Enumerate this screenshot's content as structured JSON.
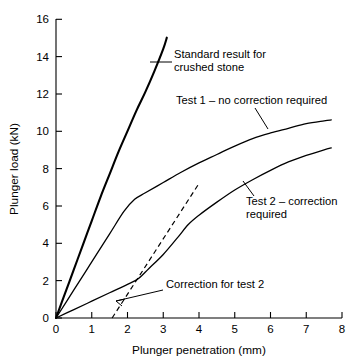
{
  "chart_data": {
    "type": "line",
    "title": "",
    "xlabel": "Plunger penetration (mm)",
    "ylabel": "Plunger load (kN)",
    "xlim": [
      0,
      8
    ],
    "ylim": [
      0,
      16
    ],
    "xticks": [
      "0",
      "1",
      "2",
      "3",
      "4",
      "5",
      "6",
      "7",
      "8"
    ],
    "yticks": [
      "0",
      "2",
      "4",
      "6",
      "8",
      "10",
      "12",
      "14",
      "16"
    ],
    "grid": false,
    "legend_position": "none",
    "series": [
      {
        "name": "Standard result for crushed stone",
        "style": "solid-thick",
        "points": [
          [
            0.0,
            0.0
          ],
          [
            0.25,
            1.3
          ],
          [
            0.5,
            2.6
          ],
          [
            0.75,
            3.9
          ],
          [
            1.0,
            5.2
          ],
          [
            1.25,
            6.5
          ],
          [
            1.5,
            7.7
          ],
          [
            1.75,
            8.9
          ],
          [
            2.0,
            10.0
          ],
          [
            2.25,
            11.1
          ],
          [
            2.5,
            12.1
          ],
          [
            2.75,
            13.2
          ],
          [
            3.0,
            14.4
          ],
          [
            3.1,
            15.0
          ]
        ]
      },
      {
        "name": "Test 1 - no correction required",
        "style": "solid-thin",
        "points": [
          [
            0.0,
            0.0
          ],
          [
            0.5,
            1.5
          ],
          [
            1.0,
            3.0
          ],
          [
            1.5,
            4.5
          ],
          [
            1.9,
            5.7
          ],
          [
            2.2,
            6.35
          ],
          [
            2.5,
            6.7
          ],
          [
            3.0,
            7.25
          ],
          [
            3.5,
            7.8
          ],
          [
            4.0,
            8.3
          ],
          [
            4.5,
            8.75
          ],
          [
            5.0,
            9.2
          ],
          [
            5.5,
            9.6
          ],
          [
            6.0,
            9.9
          ],
          [
            6.5,
            10.15
          ],
          [
            7.0,
            10.4
          ],
          [
            7.5,
            10.55
          ],
          [
            7.7,
            10.6
          ]
        ]
      },
      {
        "name": "Test 2 - correction required",
        "style": "solid-thin",
        "points": [
          [
            0.0,
            0.0
          ],
          [
            0.5,
            0.45
          ],
          [
            1.0,
            0.9
          ],
          [
            1.5,
            1.35
          ],
          [
            2.0,
            1.8
          ],
          [
            2.3,
            2.1
          ],
          [
            2.6,
            2.65
          ],
          [
            3.0,
            3.4
          ],
          [
            3.4,
            4.3
          ],
          [
            3.7,
            5.0
          ],
          [
            4.0,
            5.5
          ],
          [
            4.5,
            6.2
          ],
          [
            5.0,
            6.85
          ],
          [
            5.5,
            7.4
          ],
          [
            6.0,
            7.9
          ],
          [
            6.5,
            8.35
          ],
          [
            7.0,
            8.7
          ],
          [
            7.5,
            9.0
          ],
          [
            7.7,
            9.1
          ]
        ]
      },
      {
        "name": "Correction for test 2",
        "style": "dashed",
        "points": [
          [
            1.57,
            0.0
          ],
          [
            4.0,
            7.2
          ]
        ]
      }
    ],
    "annotations": [
      {
        "id": "standard-result",
        "text_lines": [
          "Standard result for",
          "crushed stone"
        ],
        "text_x": 174,
        "text_y": 58,
        "leader": "M 150 62 L 172 62"
      },
      {
        "id": "test-1",
        "text_lines": [
          "Test 1 – no correction required"
        ],
        "text_x": 176,
        "text_y": 104,
        "leader": "M 255 108 L 268 129"
      },
      {
        "id": "test-2",
        "text_lines": [
          "Test 2 – correction",
          "required"
        ],
        "text_x": 246,
        "text_y": 205,
        "leader": "M 254 196 L 243 181"
      },
      {
        "id": "correction-for-test-2",
        "text_lines": [
          "Correction for test 2"
        ],
        "text_x": 166,
        "text_y": 288,
        "leader": "M 163 290 L 116 301",
        "arrow": "M 116 301 L 124 299 M 116 301 L 122 305"
      }
    ]
  },
  "colors": {
    "background": "#ffffff",
    "ink": "#000000"
  },
  "axes": {
    "x_title": "Plunger penetration (mm)",
    "y_title": "Plunger load (kN)"
  }
}
